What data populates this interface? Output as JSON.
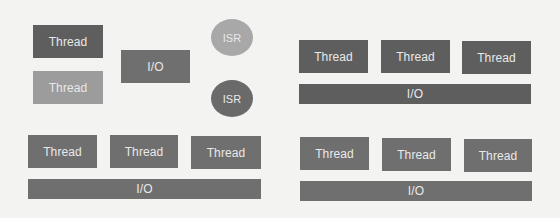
{
  "diagram": {
    "top_left": {
      "threads": [
        {
          "label": "Thread",
          "shade": "dark"
        },
        {
          "label": "Thread",
          "shade": "light"
        }
      ],
      "io": {
        "label": "I/O"
      },
      "isrs": [
        {
          "label": "ISR",
          "shade": "light"
        },
        {
          "label": "ISR",
          "shade": "dark"
        }
      ]
    },
    "top_right": {
      "threads": [
        {
          "label": "Thread"
        },
        {
          "label": "Thread"
        },
        {
          "label": "Thread"
        }
      ],
      "io": {
        "label": "I/O"
      }
    },
    "bottom_left": {
      "threads": [
        {
          "label": "Thread"
        },
        {
          "label": "Thread"
        },
        {
          "label": "Thread"
        }
      ],
      "io": {
        "label": "I/O"
      }
    },
    "bottom_right": {
      "threads": [
        {
          "label": "Thread"
        },
        {
          "label": "Thread"
        },
        {
          "label": "Thread"
        }
      ],
      "io": {
        "label": "I/O"
      }
    }
  },
  "colors": {
    "background": "#f3f3f2",
    "dark_block": "#5e5e5e",
    "mid_block": "#6f6f6f",
    "light_block": "#9c9c9c",
    "text": "#e9e9e9"
  }
}
